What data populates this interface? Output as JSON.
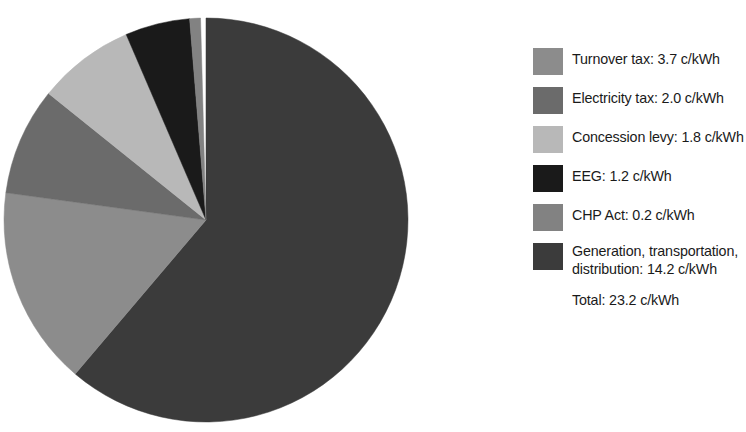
{
  "chart_data": {
    "type": "pie",
    "title": "",
    "unit": "c/kWh",
    "legend_position": "right",
    "start_angle_deg": 0,
    "direction": "clockwise",
    "categories": [
      "Turnover tax",
      "Electricity tax",
      "Concession levy",
      "EEG",
      "CHP Act",
      "Generation, transportation, distribution"
    ],
    "values": [
      3.7,
      2.0,
      1.8,
      1.2,
      0.2,
      14.2
    ],
    "total": 23.2,
    "slice_order_clockwise_from_top": [
      "Generation, transportation, distribution",
      "Turnover tax",
      "Electricity tax",
      "Concession levy",
      "EEG",
      "CHP Act"
    ],
    "colors": [
      "#8c8c8c",
      "#6b6b6b",
      "#b8b8b8",
      "#1a1a1a",
      "#828282",
      "#3b3b3b"
    ]
  },
  "legend": {
    "items": [
      {
        "label": "Turnover tax: 3.7 c/kWh",
        "name": "Turnover tax",
        "value": 3.7,
        "color": "#8c8c8c",
        "swatch_name": "legend-swatch-turnover-tax"
      },
      {
        "label": "Electricity tax: 2.0 c/kWh",
        "name": "Electricity tax",
        "value": 2.0,
        "color": "#6b6b6b",
        "swatch_name": "legend-swatch-electricity-tax"
      },
      {
        "label": "Concession levy: 1.8 c/kWh",
        "name": "Concession levy",
        "value": 1.8,
        "color": "#b8b8b8",
        "swatch_name": "legend-swatch-concession-levy"
      },
      {
        "label": "EEG: 1.2 c/kWh",
        "name": "EEG",
        "value": 1.2,
        "color": "#1a1a1a",
        "swatch_name": "legend-swatch-eeg"
      },
      {
        "label": "CHP Act: 0.2 c/kWh",
        "name": "CHP Act",
        "value": 0.2,
        "color": "#828282",
        "swatch_name": "legend-swatch-chp-act"
      },
      {
        "label": "Generation, transportation,\ndistribution: 14.2 c/kWh",
        "name": "Generation, transportation, distribution",
        "value": 14.2,
        "color": "#3b3b3b",
        "swatch_name": "legend-swatch-generation"
      }
    ],
    "total_label": "Total: 23.2 c/kWh"
  },
  "pie": {
    "center_x": 206,
    "center_y": 220,
    "radius": 202
  }
}
